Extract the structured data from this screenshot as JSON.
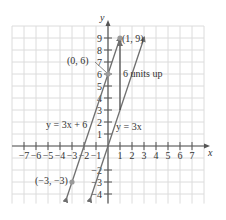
{
  "chart_data": {
    "type": "line",
    "title": "",
    "xlabel": "x",
    "ylabel": "y",
    "xlim": [
      -8,
      8
    ],
    "ylim": [
      -5,
      10
    ],
    "grid": true,
    "x_ticks": [
      -7,
      -6,
      -5,
      -4,
      -3,
      -2,
      -1,
      1,
      2,
      3,
      4,
      5,
      6,
      7
    ],
    "x_tick_labels": [
      "−7",
      "−6",
      "−5",
      "−4",
      "−3",
      "−2",
      "−1",
      "1",
      "2",
      "3",
      "4",
      "5",
      "6",
      "7"
    ],
    "y_ticks": [
      -4,
      -3,
      -2,
      1,
      2,
      3,
      4,
      5,
      6,
      7,
      8,
      9
    ],
    "y_tick_labels": [
      "−4",
      "−3",
      "−2",
      "1",
      "2",
      "3",
      "4",
      "5",
      "6",
      "7",
      "8",
      "9"
    ],
    "series": [
      {
        "name": "y = 3x + 6",
        "equation": "y = 3x + 6",
        "slope": 3,
        "intercept": 6,
        "x_range": [
          -3.43,
          1.03
        ],
        "points": [
          {
            "x": 0,
            "y": 6,
            "label": "(0, 6)"
          },
          {
            "x": -3,
            "y": -3,
            "label": "(−3, −3)"
          },
          {
            "x": 1,
            "y": 9,
            "label": "(1, 9)"
          }
        ]
      },
      {
        "name": "y = 3x",
        "equation": "y = 3x",
        "slope": 3,
        "intercept": 0,
        "x_range": [
          -1.43,
          3.03
        ],
        "points": [
          {
            "x": 0,
            "y": 0
          },
          {
            "x": 1,
            "y": 3
          }
        ]
      }
    ],
    "annotations": [
      {
        "type": "vertical-arrow",
        "from": [
          1,
          3
        ],
        "to": [
          1,
          9
        ],
        "text": "6 units up"
      },
      {
        "type": "point-label",
        "text": "(1, 9)",
        "at": [
          1,
          9
        ]
      },
      {
        "type": "point-label",
        "text": "(0, 6)",
        "at": [
          0,
          6
        ]
      },
      {
        "type": "point-label",
        "text": "(−3, −3)",
        "at": [
          -3,
          -3
        ]
      },
      {
        "type": "line-label",
        "text": "y = 3x + 6"
      },
      {
        "type": "line-label",
        "text": "y = 3x"
      }
    ]
  },
  "labels": {
    "x_axis": "x",
    "y_axis": "y",
    "line1": "y = 3x + 6",
    "line2": "y = 3x",
    "point_0_6": "(0, 6)",
    "point_neg3": "(−3, −3)",
    "point_1_9": "(1, 9)",
    "shift": "6 units up"
  },
  "colors": {
    "grid": "#dcdcdc",
    "axis": "#555555",
    "line": "#6e6e6e",
    "point": "#9a9a9a",
    "text": "#333333"
  }
}
